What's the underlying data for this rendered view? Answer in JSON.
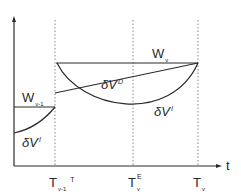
{
  "diagram": {
    "axes": {
      "x_label": "t",
      "colors": {
        "line": "#2a2a2a",
        "dotted": "#888888",
        "background": "#ffffff"
      }
    },
    "ticks": [
      {
        "main": "T",
        "sub": "v-1",
        "sup": "T"
      },
      {
        "main": "T",
        "sub": "v",
        "sup": "E"
      },
      {
        "main": "T",
        "sub": "v",
        "sup": ""
      }
    ],
    "labels": {
      "w_prev": {
        "main": "W",
        "sub": "v-1"
      },
      "w_curr": {
        "main": "W",
        "sub": "v"
      },
      "dv_prev": {
        "main": "δV",
        "sup": "I"
      },
      "dv_d": {
        "main": "δV",
        "sup": "D"
      },
      "dv_curr": {
        "main": "δV",
        "sup": "I"
      }
    }
  }
}
